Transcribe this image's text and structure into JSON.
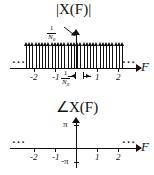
{
  "figure": {
    "kind": "dual-spectrum-plot"
  },
  "magnitude_plot": {
    "title": "|X(F)|",
    "x_axis_label": "F",
    "x_ticks": [
      "-2",
      "-1",
      "1",
      "2"
    ],
    "amplitude_label": {
      "numerator": "1",
      "denominator": "N",
      "denominator_sub": "0"
    },
    "spacing_label": {
      "numerator": "1",
      "denominator": "N",
      "denominator_sub": "0"
    },
    "left_ellipsis": "···",
    "right_ellipsis": "···",
    "impulse_count": 31
  },
  "phase_plot": {
    "title": "∠X(F)",
    "x_axis_label": "F",
    "x_ticks": [
      "-2",
      "-1",
      "1",
      "2"
    ],
    "y_top_label": "π",
    "y_bottom_label": "-π",
    "left_ellipsis": "···",
    "right_ellipsis": "···",
    "phase_value": 0
  },
  "chart_data": {
    "type": "line",
    "panels": [
      {
        "type": "bar",
        "title": "|X(F)|",
        "xlabel": "F",
        "ylabel": "1/N0",
        "xlim": [
          -2.6,
          2.6
        ],
        "ylim": [
          0,
          1
        ],
        "series": [
          {
            "name": "impulse train",
            "spacing": "1/N0",
            "height": "1/N0",
            "values": [
              1,
              1,
              1,
              1,
              1,
              1,
              1,
              1,
              1,
              1,
              1,
              1,
              1,
              1,
              1,
              1,
              1,
              1,
              1,
              1,
              1,
              1,
              1,
              1,
              1,
              1,
              1,
              1,
              1,
              1,
              1
            ]
          }
        ],
        "xticks": [
          -2,
          -1,
          1,
          2
        ],
        "xticklabels": [
          "-2",
          "-1",
          "1",
          "2"
        ],
        "grid": false
      },
      {
        "type": "line",
        "title": "∠X(F)",
        "xlabel": "F",
        "ylabel": "phase",
        "xlim": [
          -2.6,
          2.6
        ],
        "ylim": [
          -3.14159,
          3.14159
        ],
        "yticks": [
          3.14159,
          -3.14159
        ],
        "yticklabels": [
          "π",
          "-π"
        ],
        "xticks": [
          -2,
          -1,
          1,
          2
        ],
        "xticklabels": [
          "-2",
          "-1",
          "1",
          "2"
        ],
        "series": [
          {
            "name": "phase",
            "constant_value": 0
          }
        ],
        "grid": false
      }
    ]
  }
}
